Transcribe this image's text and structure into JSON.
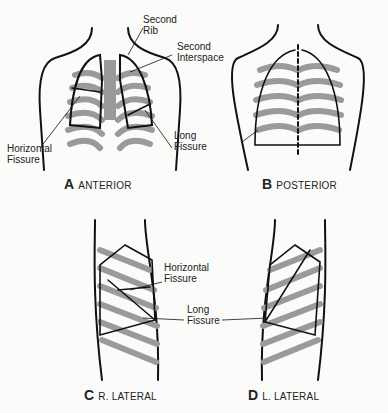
{
  "figure": {
    "panels": [
      {
        "letter": "A",
        "title": "ANTERIOR"
      },
      {
        "letter": "B",
        "title": "POSTERIOR"
      },
      {
        "letter": "C",
        "title": "R. LATERAL"
      },
      {
        "letter": "D",
        "title": "L. LATERAL"
      }
    ],
    "labels": {
      "second_rib": "Second\nRib",
      "second_interspace": "Second\nInterspace",
      "horizontal_fissure_a": "Horizontal\nFissure",
      "long_fissure_a": "Long\nFissure",
      "horizontal_fissure_c": "Horizontal\nFissure",
      "long_fissure_cd": "Long\nFissure"
    },
    "colors": {
      "outline": "#111111",
      "rib": "#9a9a9a",
      "background": "#fbfbfa"
    }
  }
}
